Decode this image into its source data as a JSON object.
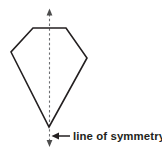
{
  "diagram": {
    "background_color": "#ffffff",
    "shape": {
      "name": "pentagon-kite",
      "stroke_color": "#231f20",
      "stroke_width": 1.6,
      "fill": "none",
      "vertices": [
        {
          "label": "top-left",
          "x": 33,
          "y": 28
        },
        {
          "label": "top-right",
          "x": 66,
          "y": 28
        },
        {
          "label": "right",
          "x": 87,
          "y": 58
        },
        {
          "label": "bottom",
          "x": 49,
          "y": 127
        },
        {
          "label": "left",
          "x": 11,
          "y": 52
        }
      ]
    },
    "symmetry_line": {
      "name": "line-of-symmetry",
      "style": "dashed",
      "color": "#6d6e71",
      "x": 49.5,
      "y_top": 14,
      "y_bottom": 142,
      "arrow_top": true,
      "arrow_bottom": true
    },
    "callout": {
      "label": "line of symmetry",
      "arrow_direction": "left",
      "arrow_color": "#231f20",
      "arrow_x_start": 70,
      "arrow_x_end": 53,
      "arrow_y": 136,
      "text_x": 73,
      "text_y": 140
    }
  }
}
